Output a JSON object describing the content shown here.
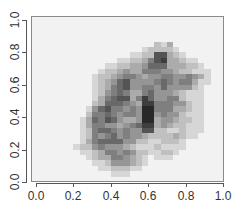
{
  "chart_data": {
    "type": "heatmap",
    "title": "",
    "xlabel": "",
    "ylabel": "",
    "xlim": [
      0.0,
      1.0
    ],
    "ylim": [
      0.0,
      1.0
    ],
    "x_ticks": [
      "0.0",
      "0.2",
      "0.4",
      "0.6",
      "0.8",
      "1.0"
    ],
    "y_ticks": [
      "0.0",
      "0.2",
      "0.4",
      "0.6",
      "0.8",
      "1.0"
    ],
    "grid": false,
    "legend": null,
    "colormap": "grayscale (light = low density, dark = high density)",
    "background_color": "#f2f2f2",
    "bins": [
      30,
      30
    ],
    "rows_top_to_bottom": [
      "000000000000000000000000000000",
      "000000000000000000000000000000",
      "000000000000000000000000000000",
      "000000000000000000000000000000",
      "000000000000000000021300000000",
      "000000000000000001222210000000",
      "000000000000000112277321000000",
      "000000000000011223578332110000",
      "000000000001122334666333221000",
      "000000000012234335554432211100",
      "000000000122345543445544543100",
      "000000000123467444456545531100",
      "000000000123567445546444421000",
      "000000000124565335644432111000",
      "000000000135677358644552111000",
      "000000000236665438855544211000",
      "000000001467554549955533211000",
      "000000002556545549945442111000",
      "000000013657643349934432211000",
      "000000013554434568834322111000",
      "000000012566545447722112111000",
      "000000012545645443222232110000",
      "000000013566664422112221000000",
      "000000122454443211121111000000",
      "000000011235545422112210000000",
      "000000001233554321011100000000",
      "000000000112444321000000000000",
      "000000000011222110000000000000",
      "000000000000111000000000000000",
      "000000000000000000000000000000"
    ]
  }
}
